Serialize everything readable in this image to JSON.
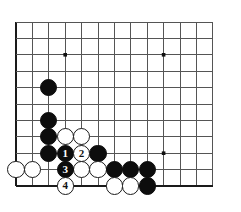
{
  "board": {
    "type": "go-board-diagram",
    "columns": 13,
    "rows": 11,
    "origin_x": 16,
    "origin_y": 22,
    "cell": 16.4,
    "line_color": "#555555",
    "edge_color": "#1a1a1a",
    "background": "#ffffff",
    "stone_radius": 8.6,
    "star_points": [
      {
        "col": 3,
        "row": 2
      },
      {
        "col": 9,
        "row": 2
      },
      {
        "col": 9,
        "row": 8
      }
    ],
    "stones": [
      {
        "col": 2,
        "row": 4,
        "color": "black",
        "label": ""
      },
      {
        "col": 2,
        "row": 6,
        "color": "black",
        "label": ""
      },
      {
        "col": 2,
        "row": 7,
        "color": "black",
        "label": ""
      },
      {
        "col": 2,
        "row": 8,
        "color": "black",
        "label": ""
      },
      {
        "col": 3,
        "row": 7,
        "color": "white",
        "label": ""
      },
      {
        "col": 4,
        "row": 7,
        "color": "white",
        "label": ""
      },
      {
        "col": 5,
        "row": 8,
        "color": "black",
        "label": ""
      },
      {
        "col": 0,
        "row": 9,
        "color": "white",
        "label": ""
      },
      {
        "col": 1,
        "row": 9,
        "color": "white",
        "label": ""
      },
      {
        "col": 4,
        "row": 9,
        "color": "white",
        "label": ""
      },
      {
        "col": 5,
        "row": 9,
        "color": "white",
        "label": ""
      },
      {
        "col": 6,
        "row": 9,
        "color": "black",
        "label": ""
      },
      {
        "col": 7,
        "row": 9,
        "color": "black",
        "label": ""
      },
      {
        "col": 8,
        "row": 9,
        "color": "black",
        "label": ""
      },
      {
        "col": 6,
        "row": 10,
        "color": "white",
        "label": ""
      },
      {
        "col": 7,
        "row": 10,
        "color": "white",
        "label": ""
      },
      {
        "col": 8,
        "row": 10,
        "color": "black",
        "label": ""
      },
      {
        "col": 3,
        "row": 8,
        "color": "black",
        "label": "1"
      },
      {
        "col": 4,
        "row": 8,
        "color": "white",
        "label": "2"
      },
      {
        "col": 3,
        "row": 9,
        "color": "black",
        "label": "3"
      },
      {
        "col": 3,
        "row": 10,
        "color": "white",
        "label": "4"
      }
    ],
    "move_sequence": [
      {
        "number": "1",
        "color": "black"
      },
      {
        "number": "2",
        "color": "white"
      },
      {
        "number": "3",
        "color": "black"
      },
      {
        "number": "4",
        "color": "white"
      }
    ]
  }
}
